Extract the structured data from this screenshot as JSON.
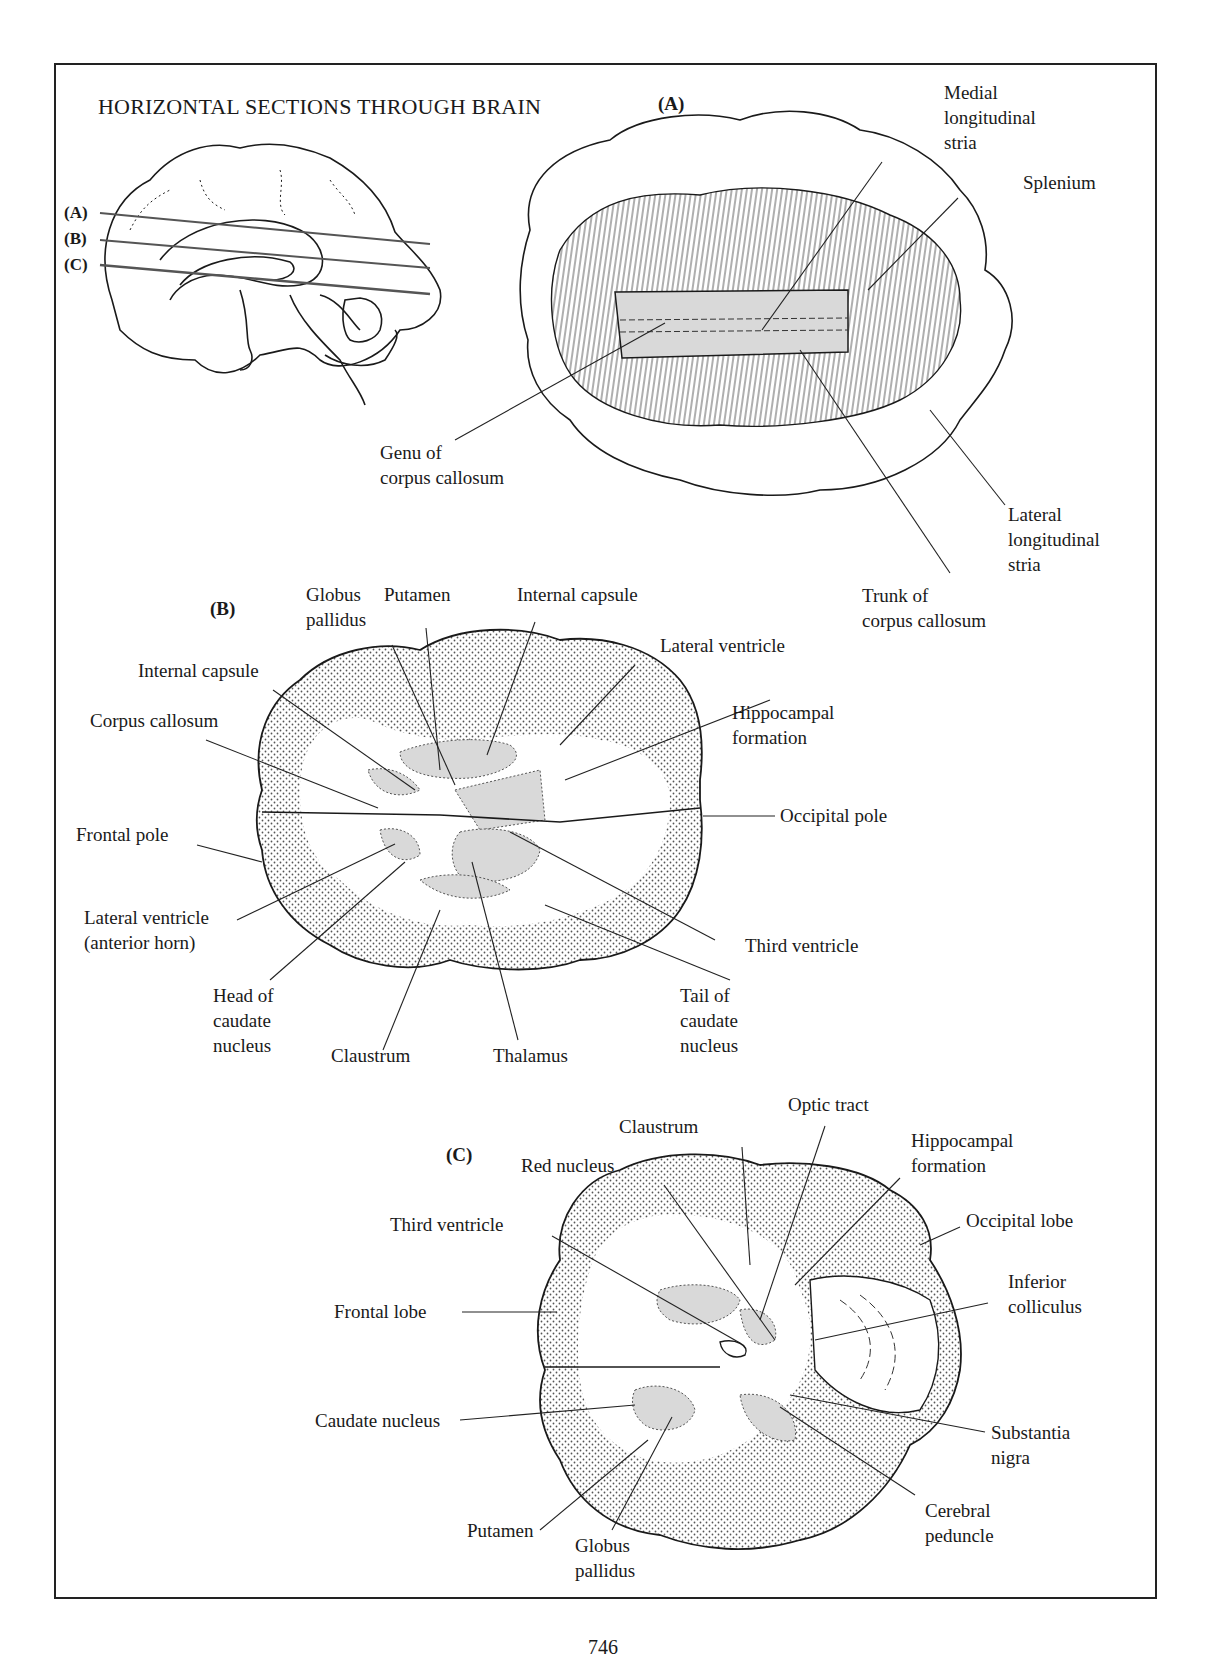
{
  "figure": {
    "title": "HORIZONTAL SECTIONS THROUGH BRAIN",
    "page_number": "746"
  },
  "sagittal": {
    "cut_labels": [
      "(A)",
      "(B)",
      "(C)"
    ]
  },
  "panel_a": {
    "label": "(A)",
    "structures": {
      "medial_longitudinal_stria": "Medial\nlongitudinal\nstria",
      "splenium": "Splenium",
      "genu": "Genu of\ncorpus callosum",
      "lateral_longitudinal_stria": "Lateral\nlongitudinal\nstria",
      "trunk": "Trunk of\ncorpus callosum"
    }
  },
  "panel_b": {
    "label": "(B)",
    "structures": {
      "globus_pallidus": "Globus\npallidus",
      "putamen": "Putamen",
      "internal_capsule_top": "Internal capsule",
      "internal_capsule_left": "Internal capsule",
      "lateral_ventricle": "Lateral ventricle",
      "corpus_callosum": "Corpus callosum",
      "hippocampal_formation": "Hippocampal\nformation",
      "frontal_pole": "Frontal pole",
      "occipital_pole": "Occipital pole",
      "lateral_ventricle_anterior": "Lateral ventricle\n(anterior horn)",
      "third_ventricle": "Third ventricle",
      "head_caudate": "Head of\ncaudate\nnucleus",
      "claustrum": "Claustrum",
      "thalamus": "Thalamus",
      "tail_caudate": "Tail of\ncaudate\nnucleus"
    }
  },
  "panel_c": {
    "label": "(C)",
    "structures": {
      "optic_tract": "Optic tract",
      "claustrum": "Claustrum",
      "red_nucleus": "Red nucleus",
      "hippocampal_formation": "Hippocampal\nformation",
      "third_ventricle": "Third ventricle",
      "occipital_lobe": "Occipital lobe",
      "frontal_lobe": "Frontal lobe",
      "inferior_colliculus": "Inferior\ncolliculus",
      "caudate_nucleus": "Caudate nucleus",
      "substantia_nigra": "Substantia\nnigra",
      "putamen": "Putamen",
      "globus_pallidus": "Globus\npallidus",
      "cerebral_peduncle": "Cerebral\npeduncle"
    }
  },
  "colors": {
    "ink": "#1a1a1a",
    "gray_fill": "#d9d9d9",
    "cortex_stipple": "#555555"
  }
}
